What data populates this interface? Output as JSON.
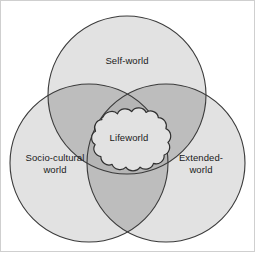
{
  "diagram": {
    "type": "venn-three-circle",
    "frame": {
      "border_color": "#c9c9c9",
      "background": "#ffffff"
    },
    "palette": {
      "circle_fill": "#e2e2e2",
      "pair_overlap_fill": "#bdbdbd",
      "triple_overlap_fill": "#bdbdbd",
      "cloud_fill": "#e2e2e2",
      "stroke": "#3a3a3a",
      "text": "#1a1a1a"
    },
    "circles": [
      {
        "id": "self-world",
        "label": "Self-world",
        "cx": 127,
        "cy": 95,
        "r": 79
      },
      {
        "id": "socio-cultural-world",
        "label": "Socio-cultural\nworld",
        "cx": 89,
        "cy": 163,
        "r": 79
      },
      {
        "id": "extended-world",
        "label": "Extended-\nworld",
        "cx": 166,
        "cy": 163,
        "r": 79
      }
    ],
    "center": {
      "id": "lifeworld",
      "label": "Lifeworld",
      "shape": "cloud",
      "cx": 129,
      "cy": 142
    }
  }
}
